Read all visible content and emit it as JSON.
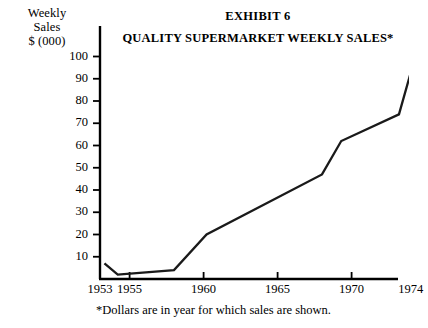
{
  "figure": {
    "title": "EXHIBIT 6",
    "subtitle": "QUALITY SUPERMARKET WEEKLY SALES*",
    "footnote": "*Dollars are in year for which sales are shown.",
    "y_caption_lines": [
      "Weekly",
      "Sales",
      "$ (000)"
    ],
    "line_color": "#1a1a1a",
    "axis_color": "#000000",
    "background_color": "#ffffff"
  },
  "chart_data": {
    "type": "line",
    "subtitle": "QUALITY SUPERMARKET WEEKLY SALES*",
    "xlabel": "",
    "ylabel": "Weekly Sales $ (000)",
    "xlim": [
      1953,
      1975
    ],
    "ylim": [
      0,
      105
    ],
    "grid": false,
    "legend": false,
    "x_ticks": [
      1953,
      1955,
      1960,
      1965,
      1970,
      1974
    ],
    "x_tick_labels": [
      "1953",
      "1955",
      "1960",
      "1965",
      "1970",
      "1974"
    ],
    "y_ticks": [
      10,
      20,
      30,
      40,
      50,
      60,
      70,
      80,
      90,
      100
    ],
    "y_tick_labels": [
      "10",
      "20",
      "30",
      "40",
      "50",
      "60",
      "70",
      "80",
      "90",
      "100"
    ],
    "series": [
      {
        "name": "Weekly Sales",
        "x": [
          1953.3,
          1954.2,
          1958.0,
          1960.2,
          1968.0,
          1969.3,
          1973.2,
          1974.3
        ],
        "values": [
          7,
          2,
          4,
          20,
          47,
          62,
          74,
          100
        ]
      }
    ],
    "annotations": [
      "*Dollars are in year for which sales are shown."
    ]
  }
}
